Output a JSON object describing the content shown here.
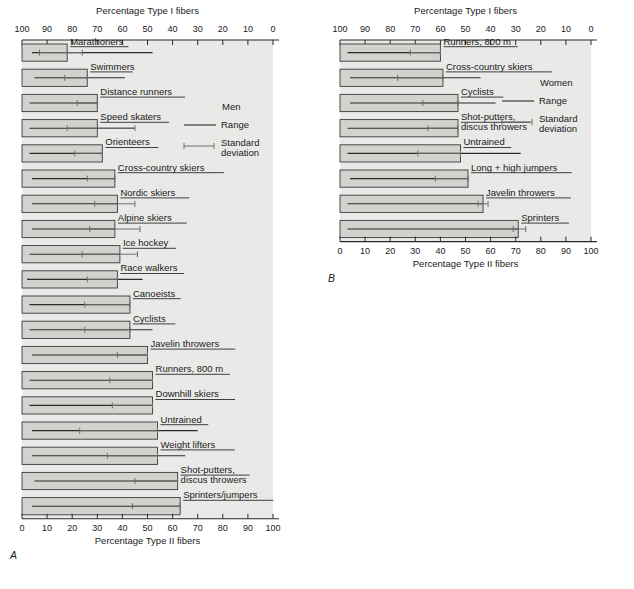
{
  "figure": {
    "panel_a_letter": "A",
    "panel_b_letter": "B"
  },
  "chart_data": [
    {
      "id": "panel_a",
      "type": "bar",
      "title": "",
      "panel_letter": "A",
      "group": "Men",
      "top_axis_label": "Percentage Type I fibers",
      "bottom_axis_label": "Percentage Type II fibers",
      "top_ticks": [
        100,
        90,
        80,
        70,
        60,
        50,
        40,
        30,
        20,
        10,
        0
      ],
      "bottom_ticks": [
        0,
        10,
        20,
        30,
        40,
        50,
        60,
        70,
        80,
        90,
        100
      ],
      "xlim": [
        0,
        100
      ],
      "grid": false,
      "legend": {
        "title": "Men",
        "range_label": "Range",
        "sd_label_line1": "Standard",
        "sd_label_line2": "deviation"
      },
      "categories": [
        "Marathoners",
        "Swimmers",
        "Distance runners",
        "Speed skaters",
        "Orienteers",
        "Cross-country skiers",
        "Nordic skiers",
        "Alpine skiers",
        "Ice hockey",
        "Race walkers",
        "Canoeists",
        "Cyclists",
        "Javelin throwers",
        "Runners, 800 m",
        "Downhill skiers",
        "Untrained",
        "Weight lifters",
        "Shot-putters, discus throwers",
        "Sprinters/jumpers"
      ],
      "series": [
        {
          "name": "Percentage Type II fibers (bar value)",
          "values": [
            18,
            26,
            30,
            30,
            32,
            37,
            38,
            37,
            39,
            38,
            43,
            43,
            50,
            52,
            52,
            54,
            56,
            62,
            63
          ]
        }
      ],
      "rows": [
        {
          "label": "Marathoners",
          "type2": 18,
          "range_min": 4,
          "range_max": 52,
          "sd_min": 7,
          "sd_max": 24,
          "label_underline": true
        },
        {
          "label": "Swimmers",
          "type2": 26,
          "range_min": 5,
          "range_max": 41,
          "sd_min": 17,
          "sd_max": 26,
          "label_underline": true
        },
        {
          "label": "Distance runners",
          "type2": 30,
          "range_min": 3,
          "range_max": 30,
          "sd_min": 22,
          "sd_max": 30,
          "label_underline": true
        },
        {
          "label": "Speed skaters",
          "type2": 30,
          "range_min": 3,
          "range_max": 45,
          "sd_min": 18,
          "sd_max": 45,
          "label_underline": true
        },
        {
          "label": "Orienteers",
          "type2": 32,
          "range_min": 3,
          "range_max": 32,
          "sd_min": 21,
          "sd_max": 32,
          "label_underline": true
        },
        {
          "label": "Cross-country skiers",
          "type2": 37,
          "range_min": 4,
          "range_max": 37,
          "sd_min": 26,
          "sd_max": 37,
          "label_underline": true
        },
        {
          "label": "Nordic skiers",
          "type2": 38,
          "range_min": 4,
          "range_max": 38,
          "sd_min": 29,
          "sd_max": 45,
          "label_underline": true
        },
        {
          "label": "Alpine skiers",
          "type2": 37,
          "range_min": 4,
          "range_max": 37,
          "sd_min": 27,
          "sd_max": 47,
          "label_underline": true
        },
        {
          "label": "Ice hockey",
          "type2": 39,
          "range_min": 3,
          "range_max": 39,
          "sd_min": 24,
          "sd_max": 46,
          "label_underline": true
        },
        {
          "label": "Race walkers",
          "type2": 38,
          "range_min": 2,
          "range_max": 48,
          "sd_min": 26,
          "sd_max": 38,
          "label_underline": true
        },
        {
          "label": "Canoeists",
          "type2": 43,
          "range_min": 3,
          "range_max": 43,
          "sd_min": 25,
          "sd_max": 43,
          "label_underline": true
        },
        {
          "label": "Cyclists",
          "type2": 43,
          "range_min": 3,
          "range_max": 52,
          "sd_min": 25,
          "sd_max": 43,
          "label_underline": true
        },
        {
          "label": "Javelin throwers",
          "type2": 50,
          "range_min": 4,
          "range_max": 50,
          "sd_min": 38,
          "sd_max": 50,
          "label_underline": true
        },
        {
          "label": "Runners, 800 m",
          "type2": 52,
          "range_min": 3,
          "range_max": 52,
          "sd_min": 35,
          "sd_max": 52,
          "label_underline": true
        },
        {
          "label": "Downhill skiers",
          "type2": 52,
          "range_min": 3,
          "range_max": 52,
          "sd_min": 36,
          "sd_max": 52,
          "label_underline": true
        },
        {
          "label": "Untrained",
          "type2": 54,
          "range_min": 4,
          "range_max": 70,
          "sd_min": 23,
          "sd_max": 54,
          "label_underline": true
        },
        {
          "label": "Weight lifters",
          "type2": 54,
          "range_min": 4,
          "range_max": 65,
          "sd_min": 34,
          "sd_max": 54,
          "label_underline": true
        },
        {
          "label": "Shot-putters, discus throwers",
          "type2": 62,
          "range_min": 5,
          "range_max": 62,
          "sd_min": 45,
          "sd_max": 62,
          "label_underline": true
        },
        {
          "label": "Sprinters/jumpers",
          "type2": 63,
          "range_min": 4,
          "range_max": 63,
          "sd_min": 44,
          "sd_max": 63,
          "label_underline": true
        }
      ]
    },
    {
      "id": "panel_b",
      "type": "bar",
      "title": "",
      "panel_letter": "B",
      "group": "Women",
      "top_axis_label": "Percentage Type I fibers",
      "bottom_axis_label": "Percentage Type II fibers",
      "top_ticks": [
        100,
        90,
        80,
        70,
        60,
        50,
        40,
        30,
        20,
        10,
        0
      ],
      "bottom_ticks": [
        0,
        10,
        20,
        30,
        40,
        50,
        60,
        70,
        80,
        90,
        100
      ],
      "xlim": [
        0,
        100
      ],
      "grid": false,
      "legend": {
        "title": "Women",
        "range_label": "Range",
        "sd_label_line1": "Standard",
        "sd_label_line2": "deviation"
      },
      "categories": [
        "Runners, 800 m",
        "Cross-country skiers",
        "Cyclists",
        "Shot-putters, discus throwers",
        "Untrained",
        "Long + high jumpers",
        "Javelin throwers",
        "Sprinters"
      ],
      "series": [
        {
          "name": "Percentage Type II fibers (bar value)",
          "values": [
            40,
            41,
            47,
            47,
            48,
            51,
            57,
            71
          ]
        }
      ],
      "rows": [
        {
          "label": "Runners, 800 m",
          "type2": 40,
          "range_min": 3,
          "range_max": 40,
          "sd_min": 28,
          "sd_max": 40,
          "label_underline": true
        },
        {
          "label": "Cross-country skiers",
          "type2": 41,
          "range_min": 4,
          "range_max": 56,
          "sd_min": 23,
          "sd_max": 41,
          "label_underline": true
        },
        {
          "label": "Cyclists",
          "type2": 47,
          "range_min": 4,
          "range_max": 62,
          "sd_min": 33,
          "sd_max": 47,
          "label_underline": true
        },
        {
          "label": "Shot-putters, discus throwers",
          "type2": 47,
          "range_min": 3,
          "range_max": 47,
          "sd_min": 35,
          "sd_max": 47,
          "label_underline": true
        },
        {
          "label": "Untrained",
          "type2": 48,
          "range_min": 3,
          "range_max": 72,
          "sd_min": 31,
          "sd_max": 48,
          "label_underline": true
        },
        {
          "label": "Long + high jumpers",
          "type2": 51,
          "range_min": 4,
          "range_max": 51,
          "sd_min": 38,
          "sd_max": 51,
          "label_underline": true
        },
        {
          "label": "Javelin throwers",
          "type2": 57,
          "range_min": 3,
          "range_max": 57,
          "sd_min": 55,
          "sd_max": 59,
          "label_underline": true
        },
        {
          "label": "Sprinters",
          "type2": 71,
          "range_min": 3,
          "range_max": 71,
          "sd_min": 69,
          "sd_max": 74,
          "label_underline": true
        }
      ]
    }
  ]
}
